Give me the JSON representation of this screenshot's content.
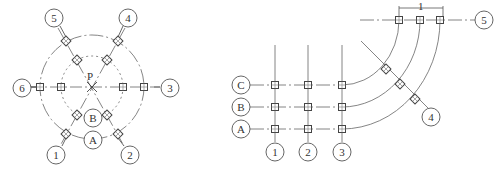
{
  "diagram": {
    "left": {
      "title": "radial-axis-grid",
      "center_label": "P",
      "radial_axes": [
        "1",
        "2",
        "3",
        "4",
        "5",
        "6"
      ],
      "ring_axes": [
        "A",
        "B"
      ]
    },
    "right": {
      "title": "orthogonal-to-curved-axis-grid",
      "row_axes": [
        "A",
        "B",
        "C"
      ],
      "column_axes": [
        "1",
        "2",
        "3"
      ],
      "curved_axes": [
        "4",
        "5"
      ],
      "dimension_label": "1"
    },
    "colors": {
      "line": "#555555",
      "background": "#ffffff"
    }
  }
}
